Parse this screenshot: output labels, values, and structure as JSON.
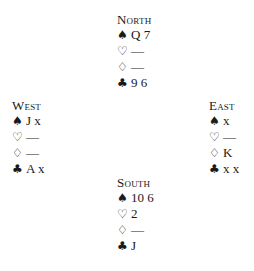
{
  "hands": {
    "north": {
      "seat": "North",
      "spades": "Q 7",
      "hearts": "—",
      "diamonds": "—",
      "clubs": "9 6"
    },
    "west": {
      "seat": "West",
      "spades": "J x",
      "hearts": "—",
      "diamonds": "—",
      "clubs": "A x"
    },
    "east": {
      "seat": "East",
      "spades": "x",
      "hearts": "—",
      "diamonds": "K",
      "clubs": "x x"
    },
    "south": {
      "seat": "South",
      "spades": "10 6",
      "hearts": "2",
      "diamonds": "—",
      "clubs": "J"
    }
  },
  "suit_symbols": {
    "spades": "♠",
    "hearts": "♡",
    "diamonds": "♢",
    "clubs": "♣"
  }
}
